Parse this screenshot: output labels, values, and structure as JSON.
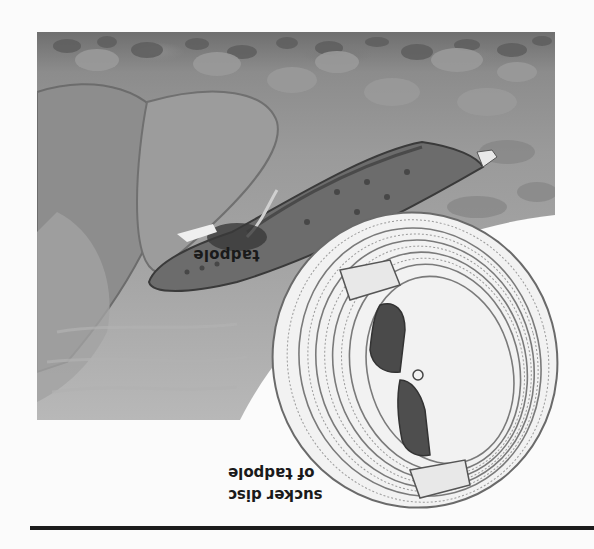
{
  "figure": {
    "orientation": "upside-down (rotated 180°)",
    "style": "grayscale illustration",
    "scene_label": "tadpole",
    "inset_caption": {
      "line1": "sucker disc",
      "line2": "of tadpole"
    },
    "colors": {
      "background": "#fbfbfb",
      "rule": "#1c1c1c",
      "text": "#1a1a1a"
    }
  }
}
